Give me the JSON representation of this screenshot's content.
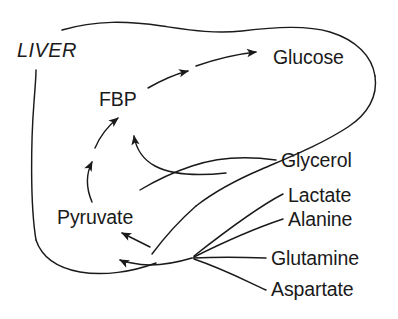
{
  "diagram": {
    "organ_label": "LIVER",
    "stroke_color": "#1a1a1a",
    "text_color": "#1a1a1a",
    "background_color": "#ffffff",
    "nodes": {
      "fbp": "FBP",
      "glucose": "Glucose",
      "pyruvate": "Pyruvate",
      "glycerol": "Glycerol",
      "lactate": "Lactate",
      "alanine": "Alanine",
      "glutamine": "Glutamine",
      "aspartate": "Aspartate"
    },
    "edges": [
      {
        "name": "pyruvate-to-fbp",
        "from": "Pyruvate",
        "to": "FBP",
        "arrow": true
      },
      {
        "name": "glycerol-to-fbp",
        "from": "Glycerol",
        "to": "FBP",
        "arrow": true
      },
      {
        "name": "fbp-to-glucose-1",
        "from": "FBP",
        "to": "Glucose",
        "arrow": true
      },
      {
        "name": "fbp-to-glucose-2",
        "from": "FBP",
        "to": "Glucose",
        "arrow": true
      },
      {
        "name": "substrates-to-pyruvate",
        "from": "Lactate/Alanine/Glutamine/Aspartate",
        "to": "Pyruvate",
        "arrow": true
      },
      {
        "name": "precursor-to-pyruvate",
        "from": "Precursor pool",
        "to": "Pyruvate",
        "arrow": true
      }
    ]
  }
}
